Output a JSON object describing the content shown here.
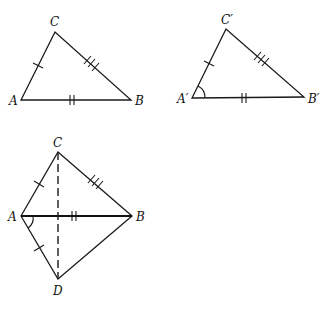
{
  "figures": {
    "triangle_abc": {
      "labels": {
        "A": "A",
        "B": "B",
        "C": "C"
      },
      "vertices": {
        "A": [
          21,
          100
        ],
        "B": [
          131,
          100
        ],
        "C": [
          55,
          32
        ]
      },
      "tick_marks": {
        "AC": 1,
        "AB": 2,
        "BC": 3
      }
    },
    "triangle_abc_prime": {
      "labels": {
        "A": "A′",
        "B": "B′",
        "C": "C′"
      },
      "vertices": {
        "A": [
          192,
          98
        ],
        "B": [
          304,
          97
        ],
        "C": [
          226,
          29
        ]
      },
      "tick_marks": {
        "AC": 1,
        "AB": 2,
        "BC": 3
      },
      "angle_mark": "A′"
    },
    "kite_construction": {
      "labels": {
        "A": "A",
        "B": "B",
        "C": "C",
        "D": "D"
      },
      "vertices": {
        "A": [
          21,
          216
        ],
        "B": [
          132,
          216
        ],
        "C": [
          58,
          152
        ],
        "D": [
          58,
          279
        ]
      },
      "tick_marks": {
        "AC": 1,
        "AD": 1,
        "AB": 2,
        "BC": 3
      },
      "dashed_segment": "CD",
      "angle_mark": "A (between AB and AD)"
    }
  },
  "colors": {
    "line": "#1a1a1a",
    "background": "#ffffff"
  }
}
